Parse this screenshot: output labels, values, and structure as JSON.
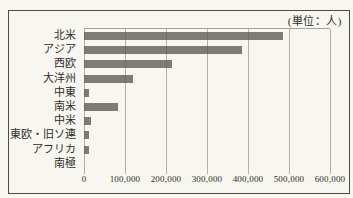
{
  "chart_data": {
    "type": "bar",
    "orientation": "horizontal",
    "title": "",
    "unit_label": "(単位：人)",
    "categories": [
      "北米",
      "アジア",
      "西欧",
      "大洋州",
      "中東",
      "南米",
      "中米",
      "東欧・旧ソ連",
      "アフリカ",
      "南極"
    ],
    "values": [
      485000,
      385000,
      215000,
      120000,
      13000,
      82000,
      17000,
      11000,
      13000,
      0
    ],
    "x_ticks": [
      "0",
      "100,000",
      "200,000",
      "300,000",
      "400,000",
      "500,000",
      "600,000"
    ],
    "xlim": [
      0,
      600000
    ],
    "xlabel": "",
    "ylabel": "",
    "grid": "vertical",
    "legend": "none",
    "colors": {
      "bar": "#7d7c77",
      "grid": "#a3a29c",
      "background": "#f7f6f0",
      "frame_border": "#4d4b47",
      "text": "#2f2d29"
    }
  }
}
